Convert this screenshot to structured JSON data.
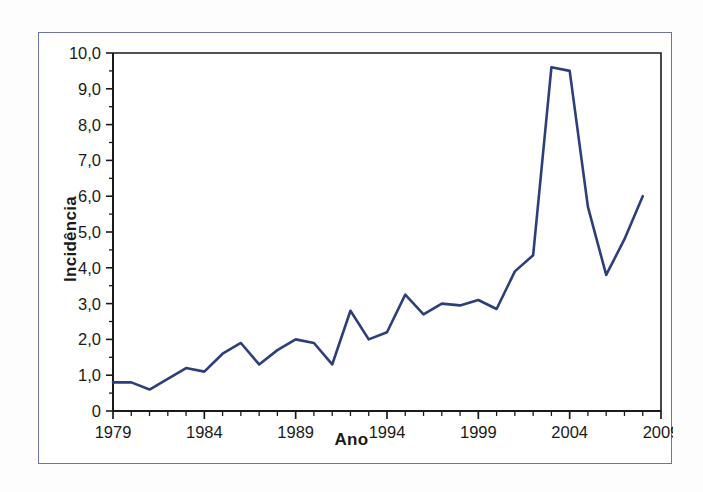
{
  "chart_data": {
    "type": "line",
    "title": "",
    "xlabel": "Ano",
    "ylabel": "Incidência",
    "xlim": [
      1979,
      2009
    ],
    "ylim": [
      0,
      10
    ],
    "grid": false,
    "legend": null,
    "line_color": "#2d3f7a",
    "x": [
      1979,
      1980,
      1981,
      1982,
      1983,
      1984,
      1985,
      1986,
      1987,
      1988,
      1989,
      1990,
      1991,
      1992,
      1993,
      1994,
      1995,
      1996,
      1997,
      1998,
      1999,
      2000,
      2001,
      2002,
      2003,
      2004,
      2005,
      2006,
      2007,
      2008
    ],
    "values": [
      0.8,
      0.8,
      0.6,
      0.9,
      1.2,
      1.1,
      1.6,
      1.9,
      1.3,
      1.7,
      2.0,
      1.9,
      1.3,
      2.8,
      2.0,
      2.2,
      3.25,
      2.7,
      3.0,
      2.95,
      3.1,
      2.85,
      3.9,
      4.35,
      9.6,
      9.5,
      5.7,
      3.8,
      4.8,
      6.0
    ],
    "y_tick_values": [
      0,
      1,
      2,
      3,
      4,
      5,
      6,
      7,
      8,
      9,
      10
    ],
    "y_tick_labels": [
      "0",
      "1,0",
      "2,0",
      "3,0",
      "4,0",
      "5,0",
      "6,0",
      "7,0",
      "8,0",
      "9,0",
      "10,0"
    ],
    "x_tick_values": [
      1979,
      1980,
      1981,
      1982,
      1983,
      1984,
      1985,
      1986,
      1987,
      1988,
      1989,
      1990,
      1991,
      1992,
      1993,
      1994,
      1995,
      1996,
      1997,
      1998,
      1999,
      2000,
      2001,
      2002,
      2003,
      2004,
      2005,
      2006,
      2007,
      2008,
      2009
    ],
    "x_labeled_ticks": [
      1979,
      1984,
      1989,
      1994,
      1999,
      2004,
      2009
    ],
    "x_labeled_text": [
      "1979",
      "1984",
      "1989",
      "1994",
      "1999",
      "2004",
      "2009"
    ]
  }
}
